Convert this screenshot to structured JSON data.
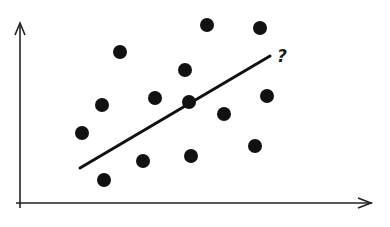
{
  "chart_data": {
    "type": "scatter",
    "title": "",
    "xlabel": "",
    "ylabel": "",
    "grid": false,
    "legend": null,
    "axis_ranges": {
      "x": [
        0,
        390
      ],
      "y": [
        0,
        227
      ]
    },
    "points_pixel": [
      {
        "x": 120,
        "y": 52
      },
      {
        "x": 207,
        "y": 25
      },
      {
        "x": 260,
        "y": 28
      },
      {
        "x": 185,
        "y": 70
      },
      {
        "x": 102,
        "y": 105
      },
      {
        "x": 155,
        "y": 98
      },
      {
        "x": 189,
        "y": 102
      },
      {
        "x": 267,
        "y": 96
      },
      {
        "x": 224,
        "y": 114
      },
      {
        "x": 82,
        "y": 133
      },
      {
        "x": 143,
        "y": 161
      },
      {
        "x": 191,
        "y": 156
      },
      {
        "x": 255,
        "y": 146
      },
      {
        "x": 104,
        "y": 180
      }
    ],
    "trend_line_pixel": {
      "x1": 80,
      "y1": 168,
      "x2": 270,
      "y2": 56
    },
    "annotations": [
      {
        "text": "?",
        "x": 277,
        "y": 62
      }
    ]
  },
  "style": {
    "ink": "#111111",
    "axis": "#222222",
    "dot_radius": 7
  }
}
